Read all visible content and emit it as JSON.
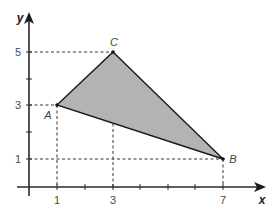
{
  "figure": {
    "axes": {
      "x_label": "x",
      "y_label": "y",
      "x_ticks_labeled": [
        "1",
        "3",
        "7"
      ],
      "y_ticks_labeled": [
        "1",
        "3",
        "5"
      ],
      "x_ticks_all": [
        1,
        2,
        3,
        4,
        5,
        6,
        7
      ],
      "y_ticks_all": [
        1,
        2,
        3,
        4,
        5
      ]
    },
    "points": {
      "A": {
        "label": "A",
        "x": 1,
        "y": 3
      },
      "B": {
        "label": "B",
        "x": 7,
        "y": 1
      },
      "C": {
        "label": "C",
        "x": 3,
        "y": 5
      }
    },
    "colors": {
      "fill": "#b3b3b3",
      "stroke": "#1a1a1a",
      "axis": "#2a2a2a",
      "dashed": "#333333"
    }
  }
}
